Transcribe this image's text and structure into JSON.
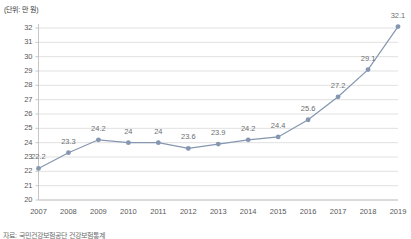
{
  "unit_label": "(단위: 만 원)",
  "caption": "자료: 국민건강보험공단 건강보험통계",
  "colors": {
    "line": "#8496b0",
    "marker": "#8496b0",
    "grid": "#d9d9d9",
    "axis": "#bfbfbf",
    "tick_text": "#58585a",
    "data_label": "#6d6e71"
  },
  "chart_data": {
    "type": "line",
    "title": "",
    "subtitle": "",
    "xlabel": "",
    "ylabel": "",
    "unit": "(단위: 만 원)",
    "categories": [
      "2007",
      "2008",
      "2009",
      "2010",
      "2011",
      "2012",
      "2013",
      "2014",
      "2015",
      "2016",
      "2017",
      "2018",
      "2019"
    ],
    "values": [
      22.2,
      23.3,
      24.2,
      24,
      24,
      23.6,
      23.9,
      24.2,
      24.4,
      25.6,
      27.2,
      29.1,
      32.1
    ],
    "data_labels": [
      "22.2",
      "23.3",
      "24.2",
      "24",
      "24",
      "23.6",
      "23.9",
      "24.2",
      "24.4",
      "25.6",
      "27.2",
      "29.1",
      "32.1"
    ],
    "series": [
      {
        "name": "",
        "values": [
          22.2,
          23.3,
          24.2,
          24,
          24,
          23.6,
          23.9,
          24.2,
          24.4,
          25.6,
          27.2,
          29.1,
          32.1
        ]
      }
    ],
    "ylim": [
      20,
      32
    ],
    "yticks": [
      20,
      21,
      22,
      23,
      24,
      25,
      26,
      27,
      28,
      29,
      30,
      31,
      32
    ],
    "ytick_labels": [
      "20",
      "21",
      "22",
      "23",
      "24",
      "25",
      "26",
      "27",
      "28",
      "29",
      "30",
      "31",
      "32"
    ],
    "xtick_labels": [
      "2007",
      "2008",
      "2009",
      "2010",
      "2011",
      "2012",
      "2013",
      "2014",
      "2015",
      "2016",
      "2017",
      "2018",
      "2019"
    ],
    "grid": true,
    "grid_axis": "y",
    "legend": false,
    "legend_position": "none",
    "markers": "circle"
  }
}
